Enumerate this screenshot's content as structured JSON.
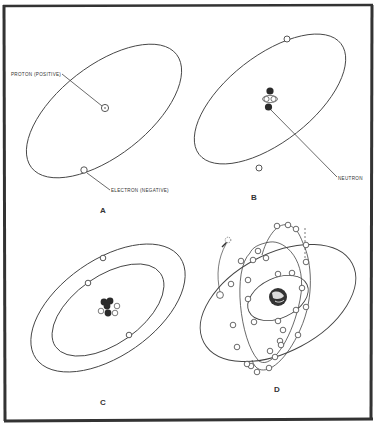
{
  "figure": {
    "panels": [
      {
        "letter": "A",
        "labels": {
          "proton": "PROTON (POSITIVE)",
          "electron": "ELECTRON (NEGATIVE)"
        }
      },
      {
        "letter": "B",
        "labels": {
          "neutron": "NEUTRON"
        }
      },
      {
        "letter": "C"
      },
      {
        "letter": "D"
      }
    ]
  },
  "colors": {
    "stroke": "#444444",
    "frame": "#333333",
    "neutron": "#2a2a2a",
    "background": "#ffffff"
  }
}
